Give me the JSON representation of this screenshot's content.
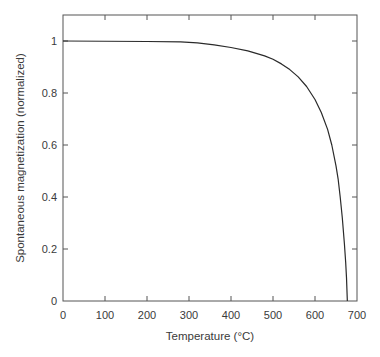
{
  "chart_data": {
    "type": "line",
    "title": "",
    "xlabel": "Temperature (°C)",
    "ylabel": "Spontaneous magnetization (normalized)",
    "xlim": [
      0,
      700
    ],
    "ylim": [
      0,
      1.1
    ],
    "grid": false,
    "legend": null,
    "x_ticks": [
      0,
      100,
      200,
      300,
      400,
      500,
      600,
      700
    ],
    "x_tick_labels": [
      "0",
      "100",
      "200",
      "300",
      "400",
      "500",
      "600",
      "700"
    ],
    "y_ticks": [
      0,
      0.2,
      0.4,
      0.6,
      0.8,
      1
    ],
    "y_tick_labels": [
      "0",
      "0.2",
      "0.4",
      "0.6",
      "0.8",
      "1"
    ],
    "series": [
      {
        "name": "Spontaneous magnetization",
        "color": "#2a2a2a",
        "x": [
          0,
          100,
          200,
          280,
          320,
          360,
          400,
          440,
          480,
          500,
          520,
          540,
          560,
          580,
          600,
          615,
          630,
          640,
          650,
          655,
          660,
          665,
          670,
          673,
          675,
          677
        ],
        "y": [
          1.0,
          0.999,
          0.998,
          0.997,
          0.993,
          0.985,
          0.975,
          0.962,
          0.943,
          0.93,
          0.912,
          0.89,
          0.862,
          0.825,
          0.775,
          0.725,
          0.66,
          0.6,
          0.52,
          0.47,
          0.4,
          0.32,
          0.22,
          0.15,
          0.09,
          0.0
        ]
      }
    ]
  },
  "colors": {
    "axis": "#555555",
    "curve": "#2a2a2a",
    "text": "#3a3a3a",
    "background": "#ffffff"
  }
}
